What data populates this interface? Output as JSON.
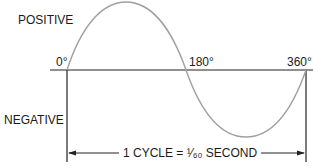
{
  "diagram": {
    "labels": {
      "positive": "POSITIVE",
      "negative": "NEGATIVE",
      "deg0": "0°",
      "deg180": "180°",
      "deg360": "360°",
      "cycle": "1 CYCLE = ¹⁄₆₀ SECOND"
    },
    "colors": {
      "wave": "#a0a0a0",
      "axis": "#222222",
      "text": "#1a1a1a"
    }
  }
}
